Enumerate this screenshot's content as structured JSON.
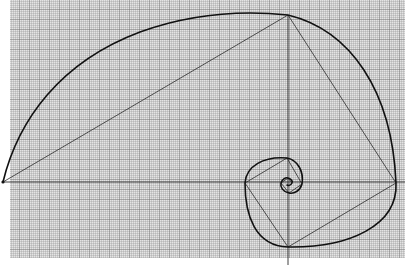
{
  "figure": {
    "title": "Golden spiral with inscribed rectangles on graph paper"
  },
  "colors": {
    "background": "#ffffff",
    "paper": "#d9d9d9",
    "grid_minor": "#9a9a9a",
    "grid_major": "#6e6e6e",
    "ink": "#1a1a1a"
  },
  "grid": {
    "left": 10,
    "top": 0,
    "right": 405,
    "bottom": 258,
    "minor_step": 2,
    "major_step": 10
  },
  "axes": {
    "horizontal_y": 182,
    "vertical_x": 288,
    "vertical_from": 15,
    "vertical_to": 265,
    "horizontal_from": 3,
    "horizontal_to": 405
  },
  "key_points": [
    {
      "name": "left",
      "x": 3,
      "y": 182
    },
    {
      "name": "top",
      "x": 288,
      "y": 15
    },
    {
      "name": "right",
      "x": 396,
      "y": 183
    },
    {
      "name": "bottom",
      "x": 288,
      "y": 247
    },
    {
      "name": "inner-left",
      "x": 245,
      "y": 183
    },
    {
      "name": "inner-top",
      "x": 287,
      "y": 158
    },
    {
      "name": "inner-right",
      "x": 302,
      "y": 184
    },
    {
      "name": "inner-bottom",
      "x": 289,
      "y": 193
    }
  ],
  "spiral": {
    "pole_x": 288,
    "pole_y": 182
  }
}
